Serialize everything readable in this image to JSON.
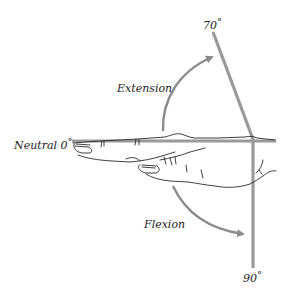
{
  "diagram": {
    "labels": {
      "neutral": "Neutral 0",
      "extension": "Extension",
      "flexion": "Flexion",
      "extension_angle": "70",
      "flexion_angle": "90",
      "degree_symbol": "°"
    },
    "colors": {
      "reference_line": "#9a9a9a",
      "arrow": "#8c8c8c",
      "hand_outline": "#2a2a2a",
      "text": "#222222",
      "background": "#ffffff"
    },
    "angles": {
      "neutral_deg": 0,
      "extension_deg": 70,
      "flexion_deg": 90
    }
  }
}
